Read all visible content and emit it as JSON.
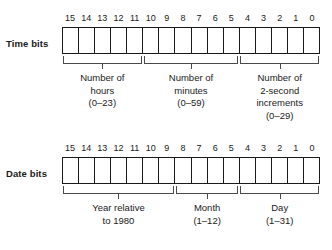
{
  "figure": {
    "ink_color": "#1a1a1a",
    "bracket_color": "#4a4a4a",
    "background": "#ffffff"
  },
  "rows": [
    {
      "id": "time",
      "label": "Time bits",
      "bit_indices": [
        "15",
        "14",
        "13",
        "12",
        "11",
        "10",
        "9",
        "8",
        "7",
        "6",
        "5",
        "4",
        "3",
        "2",
        "1",
        "0"
      ],
      "groups": [
        {
          "id": "hours",
          "start_bit": 15,
          "end_bit": 11,
          "bit_count": 5,
          "lines": [
            "Number of",
            "hours",
            "(0–23)"
          ]
        },
        {
          "id": "minutes",
          "start_bit": 10,
          "end_bit": 5,
          "bit_count": 6,
          "lines": [
            "Number of",
            "minutes",
            "(0–59)"
          ]
        },
        {
          "id": "two-second-increments",
          "start_bit": 4,
          "end_bit": 0,
          "bit_count": 5,
          "lines": [
            "Number of",
            "2-second",
            "increments",
            "(0–29)"
          ]
        }
      ]
    },
    {
      "id": "date",
      "label": "Date bits",
      "bit_indices": [
        "15",
        "14",
        "13",
        "12",
        "11",
        "10",
        "9",
        "8",
        "7",
        "6",
        "5",
        "4",
        "3",
        "2",
        "1",
        "0"
      ],
      "groups": [
        {
          "id": "year",
          "start_bit": 15,
          "end_bit": 9,
          "bit_count": 7,
          "lines": [
            "Year relative",
            "to 1980"
          ]
        },
        {
          "id": "month",
          "start_bit": 8,
          "end_bit": 5,
          "bit_count": 4,
          "lines": [
            "Month",
            "(1–12)"
          ]
        },
        {
          "id": "day",
          "start_bit": 4,
          "end_bit": 0,
          "bit_count": 5,
          "lines": [
            "Day",
            "(1–31)"
          ]
        }
      ]
    }
  ]
}
